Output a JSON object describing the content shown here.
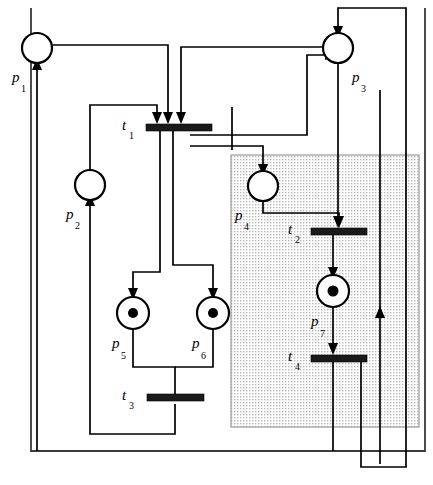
{
  "figure": {
    "type": "petri-net",
    "canvas": {
      "width": 433,
      "height": 485,
      "background": "#ffffff"
    },
    "colors": {
      "stroke": "#000000",
      "token": "#000000",
      "transition_bar": "#1a1a1a",
      "region_fill": "#e8e8e8",
      "region_stroke": "#9a9a9a",
      "outer_box_stroke": "#3a3a3a"
    }
  },
  "places": [
    {
      "id": "p1",
      "label": "p",
      "subscript": "1",
      "cx": 37,
      "cy": 48,
      "r": 15,
      "tokens": 0,
      "label_x": 14,
      "label_y": 78
    },
    {
      "id": "p2",
      "label": "p",
      "subscript": "2",
      "cx": 90,
      "cy": 185,
      "r": 15,
      "tokens": 0,
      "label_x": 67,
      "label_y": 215
    },
    {
      "id": "p3",
      "label": "p",
      "subscript": "3",
      "cx": 338,
      "cy": 48,
      "r": 15,
      "tokens": 0,
      "label_x": 352,
      "label_y": 78
    },
    {
      "id": "p4",
      "label": "p",
      "subscript": "4",
      "cx": 263,
      "cy": 186,
      "r": 15,
      "tokens": 0,
      "label_x": 236,
      "label_y": 216
    },
    {
      "id": "p5",
      "label": "p",
      "subscript": "5",
      "cx": 133,
      "cy": 313,
      "r": 16,
      "tokens": 1,
      "label_x": 113,
      "label_y": 345
    },
    {
      "id": "p6",
      "label": "p",
      "subscript": "6",
      "cx": 213,
      "cy": 313,
      "r": 16,
      "tokens": 1,
      "label_x": 193,
      "label_y": 345
    },
    {
      "id": "p7",
      "label": "p",
      "subscript": "7",
      "cx": 333,
      "cy": 291,
      "r": 16,
      "tokens": 1,
      "label_x": 312,
      "label_y": 323
    }
  ],
  "transitions": [
    {
      "id": "t1",
      "label": "t",
      "subscript": "1",
      "x": 146,
      "y": 124,
      "width": 66,
      "height": 7,
      "label_x": 124,
      "label_y": 124
    },
    {
      "id": "t2",
      "label": "t",
      "subscript": "2",
      "x": 311,
      "y": 228,
      "width": 56,
      "height": 7,
      "label_x": 289,
      "label_y": 228
    },
    {
      "id": "t3",
      "label": "t",
      "subscript": "3",
      "x": 147,
      "y": 397,
      "width": 57,
      "height": 7,
      "label_x": 124,
      "label_y": 397
    },
    {
      "id": "t4",
      "label": "t",
      "subscript": "4",
      "x": 311,
      "y": 355,
      "width": 56,
      "height": 7,
      "label_x": 289,
      "label_y": 355
    }
  ],
  "shaded_region": {
    "x": 231,
    "y": 155,
    "width": 188,
    "height": 272
  },
  "outer_box": {
    "x": 31,
    "y": 8,
    "width": 394,
    "height": 443
  },
  "arcs": [
    {
      "id": "arc-p1-t1",
      "from": "p1",
      "to": "t1",
      "points": "52,48 168,48 168,118",
      "arrow": "down",
      "arrow_at": "168,121"
    },
    {
      "id": "arc-t1-p2",
      "from": "t1",
      "to": "p2",
      "points": "90,131 90,200",
      "arrow": "up",
      "arrow_at": "90,200"
    },
    {
      "id": "arc-p2-t1",
      "from": "p2",
      "to": "t1",
      "points": "90,170 90,105 157,105 157,118",
      "arrow": "down",
      "arrow_at": "157,121"
    },
    {
      "id": "arc-p3-t1",
      "from": "p3",
      "to": "t1",
      "points": "323,48 181,48 181,118",
      "arrow": "down",
      "arrow_at": "181,121"
    },
    {
      "id": "arc-t1-p3",
      "from": "t1",
      "to": "p3",
      "points": "186,135 306,135 306,56 323,56",
      "arrow": "right",
      "arrow_at": "323,56"
    },
    {
      "id": "arc-t1-p4",
      "from": "t1",
      "to": "p4",
      "points": "178,145 263,145 263,171",
      "arrow": "down",
      "arrow_at": "263,174"
    },
    {
      "id": "arc-t1-p5",
      "from": "t1",
      "to": "p5",
      "points": "160,131 160,272 133,272 133,297",
      "arrow": "down",
      "arrow_at": "133,300"
    },
    {
      "id": "arc-t1-p6",
      "from": "t1",
      "to": "p6",
      "points": "172,131 172,267 213,267 213,297",
      "arrow": "down",
      "arrow_at": "213,300"
    },
    {
      "id": "arc-p4-t2",
      "from": "p4",
      "to": "t2",
      "points": "263,201 263,213 339,213 339,222",
      "arrow": "down",
      "arrow_at": "339,225"
    },
    {
      "id": "arc-p3-t2",
      "from": "p3",
      "to": "t2",
      "points": "338,63 338,222",
      "arrow": "down",
      "arrow_at": "338,225"
    },
    {
      "id": "arc-t2-p7",
      "from": "t2",
      "to": "p7",
      "points": "333,235 333,275",
      "arrow": "down",
      "arrow_at": "333,278"
    },
    {
      "id": "arc-p7-t4",
      "from": "p7",
      "to": "t4",
      "points": "333,307 333,349",
      "arrow": "down",
      "arrow_at": "333,352"
    },
    {
      "id": "arc-p5-t3",
      "from": "p5",
      "to": "t3",
      "points": "133,329 133,367 175,367 175,394",
      "arrow": "none",
      "arrow_at": ""
    },
    {
      "id": "arc-p6-t3",
      "from": "p6",
      "to": "t3",
      "points": "213,329 213,367 175,367",
      "arrow": "none",
      "arrow_at": ""
    },
    {
      "id": "arc-t3-p1",
      "from": "t3",
      "to": "p1",
      "points": "175,404 175,442 37,442 37,63",
      "arrow": "up",
      "arrow_at": "37,63"
    },
    {
      "id": "arc-t3-p2",
      "from": "t3",
      "to": "p2",
      "points": "175,404 175,434 90,434 90,200",
      "arrow": "up",
      "arrow_at": "90,200"
    },
    {
      "id": "arc-t4-p3",
      "from": "t4",
      "to": "p3",
      "points": "361,362 361,466 406,466 406,8 406,33 338,33",
      "arrow": "down",
      "arrow_at": "338,33"
    },
    {
      "id": "arc-t2-p3-right",
      "from": "t4",
      "to": "p3",
      "points": "345,362 345,464 380,464 380,52",
      "arrow": "up",
      "arrow_at": "380,215"
    }
  ],
  "caption": {
    "text": "Figure: Petri net model",
    "visible": false
  }
}
